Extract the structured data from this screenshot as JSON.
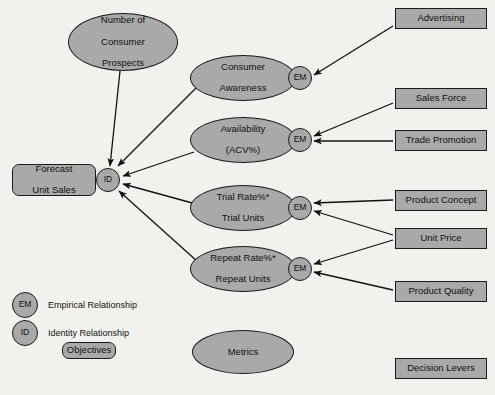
{
  "diagram": {
    "colors": {
      "node_fill": "#a9a9a9",
      "node_stroke": "#1a1a1a",
      "background": "#f2f1ee",
      "edge": "#111111",
      "text": "#111111"
    },
    "objectives": [
      {
        "id": "forecast-unit-sales",
        "label": "Forecast\nUnit Sales",
        "shape": "rounded-rect",
        "x": 12,
        "y": 164,
        "w": 84,
        "h": 32
      }
    ],
    "metrics": [
      {
        "id": "number-of-consumer-prospects",
        "label": "Number of\nConsumer\nProspects",
        "shape": "ellipse",
        "x": 68,
        "y": 13,
        "w": 110,
        "h": 58
      },
      {
        "id": "consumer-awareness",
        "label": "Consumer\nAwareness",
        "shape": "ellipse",
        "x": 190,
        "y": 55,
        "w": 106,
        "h": 46
      },
      {
        "id": "availability-acv",
        "label": "Availability\n(ACV%)",
        "shape": "ellipse",
        "x": 190,
        "y": 117,
        "w": 106,
        "h": 46
      },
      {
        "id": "trial-rate-trial-units",
        "label": "Trial Rate%*\nTrial Units",
        "shape": "ellipse",
        "x": 190,
        "y": 185,
        "w": 106,
        "h": 46
      },
      {
        "id": "repeat-rate-repeat-units",
        "label": "Repeat Rate%*\nRepeat Units",
        "shape": "ellipse",
        "x": 190,
        "y": 246,
        "w": 106,
        "h": 46
      },
      {
        "id": "metrics-key",
        "label": "Metrics",
        "shape": "ellipse",
        "x": 192,
        "y": 330,
        "w": 102,
        "h": 44
      }
    ],
    "relationship_nodes": [
      {
        "id": "id-node",
        "label": "ID",
        "shape": "circle",
        "x": 96,
        "y": 168,
        "w": 24,
        "h": 24
      },
      {
        "id": "em-awareness",
        "label": "EM",
        "shape": "circle",
        "x": 288,
        "y": 66,
        "w": 24,
        "h": 24
      },
      {
        "id": "em-availability",
        "label": "EM",
        "shape": "circle",
        "x": 288,
        "y": 128,
        "w": 24,
        "h": 24
      },
      {
        "id": "em-trial",
        "label": "EM",
        "shape": "circle",
        "x": 288,
        "y": 196,
        "w": 24,
        "h": 24
      },
      {
        "id": "em-repeat",
        "label": "EM",
        "shape": "circle",
        "x": 288,
        "y": 257,
        "w": 24,
        "h": 24
      }
    ],
    "decision_levers": [
      {
        "id": "advertising",
        "label": "Advertising",
        "shape": "rect",
        "x": 395,
        "y": 8,
        "w": 92,
        "h": 21
      },
      {
        "id": "sales-force",
        "label": "Sales Force",
        "shape": "rect",
        "x": 395,
        "y": 88,
        "w": 92,
        "h": 21
      },
      {
        "id": "trade-promotion",
        "label": "Trade Promotion",
        "shape": "rect",
        "x": 395,
        "y": 130,
        "w": 92,
        "h": 21
      },
      {
        "id": "product-concept",
        "label": "Product Concept",
        "shape": "rect",
        "x": 395,
        "y": 190,
        "w": 92,
        "h": 21
      },
      {
        "id": "unit-price",
        "label": "Unit Price",
        "shape": "rect",
        "x": 395,
        "y": 228,
        "w": 92,
        "h": 21
      },
      {
        "id": "product-quality",
        "label": "Product Quality",
        "shape": "rect",
        "x": 395,
        "y": 281,
        "w": 92,
        "h": 21
      },
      {
        "id": "decision-levers-key",
        "label": "Decision Levers",
        "shape": "rect",
        "x": 395,
        "y": 358,
        "w": 92,
        "h": 21
      }
    ],
    "legend": {
      "empirical": {
        "symbol": "EM",
        "label": "Empirical Relationship",
        "symbol_x": 12,
        "symbol_y": 292,
        "symbol_w": 26,
        "symbol_h": 26,
        "label_x": 48,
        "label_y": 300
      },
      "identity": {
        "symbol": "ID",
        "label": "Identity Relationship",
        "symbol_x": 12,
        "symbol_y": 320,
        "symbol_w": 26,
        "symbol_h": 26,
        "label_x": 48,
        "label_y": 328
      },
      "objectives": {
        "label": "Objectives",
        "x": 62,
        "y": 342,
        "w": 54,
        "h": 17
      }
    },
    "edges": [
      {
        "from": "number-of-consumer-prospects",
        "to": "id-node",
        "x1": 120,
        "y1": 71,
        "x2": 110,
        "y2": 166
      },
      {
        "from": "consumer-awareness",
        "to": "id-node",
        "x1": 196,
        "y1": 88,
        "x2": 118,
        "y2": 166
      },
      {
        "from": "availability-acv",
        "to": "id-node",
        "x1": 194,
        "y1": 152,
        "x2": 123,
        "y2": 176
      },
      {
        "from": "trial-rate-trial-units",
        "to": "id-node",
        "x1": 196,
        "y1": 204,
        "x2": 123,
        "y2": 184
      },
      {
        "from": "repeat-rate-repeat-units",
        "to": "id-node",
        "x1": 198,
        "y1": 262,
        "x2": 119,
        "y2": 191
      },
      {
        "from": "advertising",
        "to": "em-awareness",
        "x1": 393,
        "y1": 26,
        "x2": 314,
        "y2": 75
      },
      {
        "from": "sales-force",
        "to": "em-availability",
        "x1": 393,
        "y1": 103,
        "x2": 314,
        "y2": 136
      },
      {
        "from": "trade-promotion",
        "to": "em-availability",
        "x1": 393,
        "y1": 141,
        "x2": 314,
        "y2": 141
      },
      {
        "from": "product-concept",
        "to": "em-trial",
        "x1": 393,
        "y1": 200,
        "x2": 314,
        "y2": 203
      },
      {
        "from": "unit-price",
        "to": "em-trial",
        "x1": 393,
        "y1": 235,
        "x2": 314,
        "y2": 211
      },
      {
        "from": "unit-price",
        "to": "em-repeat",
        "x1": 393,
        "y1": 240,
        "x2": 314,
        "y2": 264
      },
      {
        "from": "product-quality",
        "to": "em-repeat",
        "x1": 393,
        "y1": 290,
        "x2": 314,
        "y2": 272
      }
    ]
  }
}
